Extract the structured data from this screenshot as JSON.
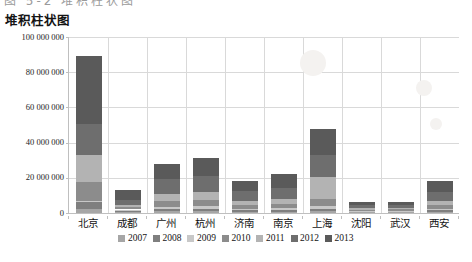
{
  "page": {
    "top_clipped_caption": "图 5-2 堆积柱状图"
  },
  "chart_data": {
    "type": "bar",
    "stacked": true,
    "title": "堆积柱状图",
    "xlabel": "",
    "ylabel": "",
    "ylim": [
      0,
      100000000
    ],
    "ytick_values": [
      0,
      20000000,
      40000000,
      60000000,
      80000000,
      100000000
    ],
    "ytick_labels": [
      "0",
      "20 000 000",
      "40 000 000",
      "60 000 000",
      "80 000 000",
      "100 000 000"
    ],
    "grid": true,
    "legend_position": "bottom",
    "categories": [
      "北京",
      "成都",
      "广州",
      "杭州",
      "济南",
      "南京",
      "上海",
      "沈阳",
      "武汉",
      "西安"
    ],
    "series": [
      {
        "name": "2007",
        "color": "#a6a6a6",
        "values": [
          2200000,
          600000,
          900000,
          900000,
          600000,
          700000,
          900000,
          400000,
          400000,
          600000
        ]
      },
      {
        "name": "2008",
        "color": "#7f7f7f",
        "values": [
          3900000,
          900000,
          1400000,
          1500000,
          900000,
          1100000,
          1500000,
          500000,
          500000,
          900000
        ]
      },
      {
        "name": "2009",
        "color": "#c8c8c8",
        "values": [
          1000000,
          500000,
          1400000,
          1500000,
          900000,
          900000,
          1700000,
          300000,
          300000,
          900000
        ]
      },
      {
        "name": "2010",
        "color": "#8c8c8c",
        "values": [
          10400000,
          1200000,
          3300000,
          3600000,
          2100000,
          2400000,
          3600000,
          700000,
          800000,
          2000000
        ]
      },
      {
        "name": "2011",
        "color": "#b3b3b3",
        "values": [
          15500000,
          1300000,
          3800000,
          4200000,
          2400000,
          2800000,
          12800000,
          800000,
          900000,
          2300000
        ]
      },
      {
        "name": "2012",
        "color": "#6e6e6e",
        "values": [
          17400000,
          2800000,
          8700000,
          9100000,
          5400000,
          6100000,
          12500000,
          1700000,
          1900000,
          5000000
        ]
      },
      {
        "name": "2013",
        "color": "#5a5a5a",
        "values": [
          38600000,
          5700000,
          8500000,
          10200000,
          5700000,
          8000000,
          15000000,
          1600000,
          1200000,
          6300000
        ]
      }
    ],
    "totals": [
      89000000,
      13000000,
      28000000,
      31000000,
      18000000,
      22000000,
      48000000,
      6000000,
      6000000,
      18000000
    ]
  },
  "legend": {
    "items": [
      {
        "label": "2007"
      },
      {
        "label": "2008"
      },
      {
        "label": "2009"
      },
      {
        "label": "2010"
      },
      {
        "label": "2011"
      },
      {
        "label": "2012"
      },
      {
        "label": "2013"
      }
    ]
  }
}
